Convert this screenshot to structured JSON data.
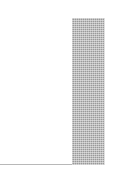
{
  "chart_data": {
    "type": "bar",
    "title": "",
    "xlabel": "",
    "ylabel": "",
    "categories": [
      ""
    ],
    "values": [
      1
    ],
    "grid": false,
    "legend": null,
    "note": "Cropped fragment showing a single hatched gray bar and baseline; no visible labels or ticks."
  },
  "colors": {
    "bar_fill": "#9a9a9a",
    "baseline": "#b8b8b8"
  }
}
